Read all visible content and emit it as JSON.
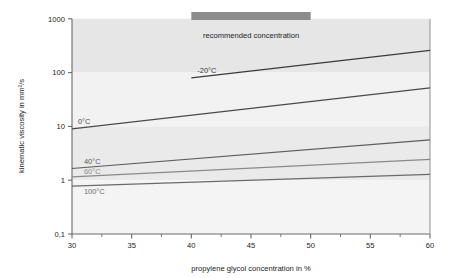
{
  "chart_data": {
    "type": "line",
    "title": "",
    "xlabel": "propylene glycol concentration in %",
    "ylabel": "kinematic viscosity in mm²/s",
    "xlim": [
      30,
      60
    ],
    "ylim": [
      0.1,
      1000
    ],
    "yscale": "log",
    "xscale": "linear",
    "grid": false,
    "legend": "inline-labels",
    "x_ticks": [
      "30",
      "35",
      "40",
      "45",
      "50",
      "55",
      "60"
    ],
    "x_tick_values": [
      30,
      35,
      40,
      45,
      50,
      55,
      60
    ],
    "x_minor_ticks": [
      32.5,
      37.5,
      42.5,
      47.5,
      52.5,
      57.5
    ],
    "y_ticks": [
      "1000",
      "100",
      "10",
      "1",
      "0,1"
    ],
    "y_tick_values": [
      1000,
      100,
      10,
      1,
      0.1
    ],
    "series": [
      {
        "name": "-20°C",
        "label": "-20°C",
        "color": "#3a3a3a",
        "x": [
          40,
          60
        ],
        "values": [
          80,
          260
        ]
      },
      {
        "name": "0°C",
        "label": "0°C",
        "color": "#4a4a4a",
        "x": [
          30,
          60
        ],
        "values": [
          9.0,
          52
        ]
      },
      {
        "name": "40°C",
        "label": "40°C",
        "color": "#5c5c5c",
        "x": [
          30,
          60
        ],
        "values": [
          1.65,
          5.6
        ]
      },
      {
        "name": "60°C",
        "label": "60°C",
        "color": "#8a8a8a",
        "x": [
          30,
          60
        ],
        "values": [
          1.15,
          2.45
        ]
      },
      {
        "name": "100°C",
        "label": "100°C",
        "color": "#6a6a6a",
        "x": [
          30,
          60
        ],
        "values": [
          0.78,
          1.28
        ]
      }
    ],
    "annotations": [
      {
        "name": "recommended-concentration",
        "text": "recommended concentration",
        "x_start": 40,
        "x_end": 50,
        "marker": "bar",
        "color": "#8c8c8c"
      }
    ],
    "background_bands": [
      {
        "from": 100,
        "to": 1000,
        "color": "#e6e6e6"
      },
      {
        "from": 10,
        "to": 100,
        "color": "#f2f2f2"
      },
      {
        "from": 1,
        "to": 10,
        "color": "#eaeaea"
      },
      {
        "from": 0.1,
        "to": 1,
        "color": "#f4f4f4"
      }
    ],
    "axis_color": "#5a5a5a",
    "frame_color": "#9a9a9a"
  }
}
